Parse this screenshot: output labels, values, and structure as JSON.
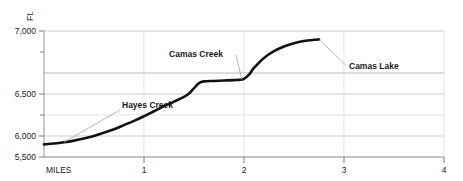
{
  "chart_data": {
    "type": "line",
    "title": "",
    "subtitle": "",
    "xlabel": "MILES",
    "ylabel": "Ft.",
    "xlim": [
      0,
      4
    ],
    "ylim": [
      5500,
      7000
    ],
    "grid": true,
    "legend": "none",
    "x_ticks": [
      {
        "value": 0,
        "label": ""
      },
      {
        "value": 1,
        "label": "1"
      },
      {
        "value": 2,
        "label": "2"
      },
      {
        "value": 3,
        "label": "3"
      },
      {
        "value": 4,
        "label": "4"
      }
    ],
    "y_ticks_major": [
      {
        "value": 5500,
        "label": "5,500"
      },
      {
        "value": 6000,
        "label": "6,000"
      },
      {
        "value": 6500,
        "label": "6,500"
      },
      {
        "value": 7000,
        "label": "7,000"
      }
    ],
    "y_ticks_minor": [
      {
        "value": 5750,
        "label": ""
      },
      {
        "value": 6250,
        "label": ""
      },
      {
        "value": 6750,
        "label": ""
      }
    ],
    "series": [
      {
        "name": "Elevation profile",
        "color": "#111111",
        "x": [
          0.0,
          0.1,
          0.2,
          0.3,
          0.4,
          0.5,
          0.6,
          0.7,
          0.8,
          0.9,
          1.0,
          1.1,
          1.2,
          1.3,
          1.4,
          1.45,
          1.5,
          1.55,
          1.6,
          1.7,
          1.8,
          1.9,
          1.95,
          2.0,
          2.05,
          2.1,
          2.2,
          2.3,
          2.4,
          2.5,
          2.6,
          2.7,
          2.75
        ],
        "y": [
          5650,
          5660,
          5675,
          5695,
          5720,
          5750,
          5790,
          5830,
          5880,
          5930,
          5985,
          6045,
          6105,
          6160,
          6215,
          6255,
          6320,
          6380,
          6400,
          6405,
          6410,
          6415,
          6418,
          6430,
          6480,
          6560,
          6680,
          6760,
          6815,
          6855,
          6880,
          6895,
          6900
        ]
      }
    ],
    "annotations": [
      {
        "id": "hayes-creek",
        "text": "Hayes Creek",
        "x": 0.2,
        "y": 5675,
        "label_x": 0.78,
        "label_y": 6085
      },
      {
        "id": "camas-creek",
        "text": "Camas Creek",
        "x": 1.98,
        "y": 6420,
        "label_x": 1.52,
        "label_y": 6690
      },
      {
        "id": "camas-lake",
        "text": "Camas Lake",
        "x": 2.75,
        "y": 6900,
        "label_x": 3.05,
        "label_y": 6545
      }
    ]
  }
}
